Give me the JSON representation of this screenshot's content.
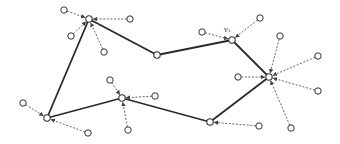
{
  "diagram": {
    "type": "graph",
    "colors": {
      "edge": "#2a2a2a",
      "dashed": "#555555",
      "node_fill": "#ffffff",
      "node_stroke": "#333333"
    },
    "labels": [
      {
        "id": "v1",
        "text": "v₁",
        "x": 224,
        "y": 29
      }
    ],
    "main_nodes": [
      {
        "id": "A",
        "x": 89,
        "y": 19
      },
      {
        "id": "B",
        "x": 157,
        "y": 55
      },
      {
        "id": "v1",
        "x": 232,
        "y": 40
      },
      {
        "id": "C",
        "x": 269,
        "y": 77
      },
      {
        "id": "D",
        "x": 210,
        "y": 122
      },
      {
        "id": "E",
        "x": 122,
        "y": 98
      },
      {
        "id": "F",
        "x": 47,
        "y": 118
      }
    ],
    "edges": [
      [
        "F",
        "A"
      ],
      [
        "A",
        "B"
      ],
      [
        "B",
        "v1"
      ],
      [
        "v1",
        "C"
      ],
      [
        "C",
        "D"
      ],
      [
        "D",
        "E"
      ],
      [
        "E",
        "F"
      ]
    ],
    "satellites": [
      {
        "x": 64,
        "y": 10,
        "to": "A"
      },
      {
        "x": 130,
        "y": 19,
        "to": "A"
      },
      {
        "x": 71,
        "y": 36,
        "to": "A"
      },
      {
        "x": 104,
        "y": 52,
        "to": "A"
      },
      {
        "x": 202,
        "y": 32,
        "to": "v1"
      },
      {
        "x": 260,
        "y": 18,
        "to": "v1"
      },
      {
        "x": 280,
        "y": 36,
        "to": "C"
      },
      {
        "x": 318,
        "y": 56,
        "to": "C"
      },
      {
        "x": 238,
        "y": 77,
        "to": "C"
      },
      {
        "x": 318,
        "y": 91,
        "to": "C"
      },
      {
        "x": 291,
        "y": 128,
        "to": "C"
      },
      {
        "x": 259,
        "y": 126,
        "to": "D"
      },
      {
        "x": 110,
        "y": 80,
        "to": "E"
      },
      {
        "x": 155,
        "y": 96,
        "to": "E"
      },
      {
        "x": 128,
        "y": 130,
        "to": "E"
      },
      {
        "x": 23,
        "y": 103,
        "to": "F"
      },
      {
        "x": 88,
        "y": 133,
        "to": "F"
      }
    ]
  }
}
